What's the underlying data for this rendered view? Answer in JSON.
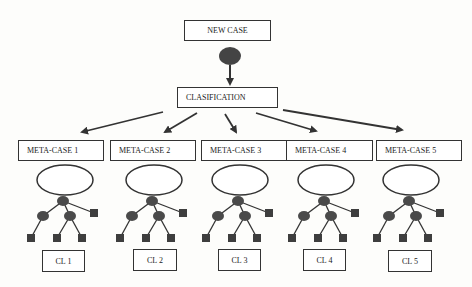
{
  "diagram": {
    "new_case": "NEW CASE",
    "classification": "CLASIFICATION",
    "meta_cases": [
      {
        "label": "META-CASE 1",
        "cluster": "CL 1"
      },
      {
        "label": "META-CASE 2",
        "cluster": "CL 2"
      },
      {
        "label": "META-CASE 3",
        "cluster": "CL 3"
      },
      {
        "label": "META-CASE 4",
        "cluster": "CL 4"
      },
      {
        "label": "META-CASE 5",
        "cluster": "CL 5"
      }
    ],
    "colors": {
      "node": "#4a4a4a",
      "line": "#333333",
      "background": "#fdfdfb"
    }
  }
}
